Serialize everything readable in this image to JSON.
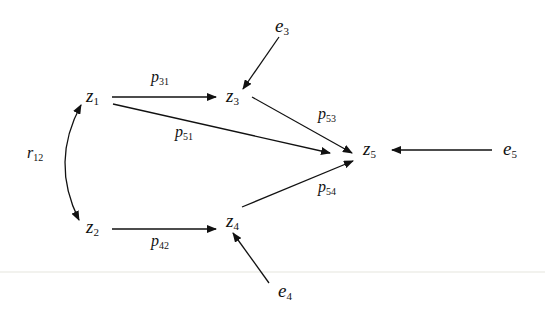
{
  "diagram": {
    "type": "path-analysis",
    "nodes": [
      {
        "id": "z1",
        "base": "z",
        "sub": "1",
        "x": 86,
        "y": 86
      },
      {
        "id": "z2",
        "base": "z",
        "sub": "2",
        "x": 86,
        "y": 217
      },
      {
        "id": "z3",
        "base": "z",
        "sub": "3",
        "x": 226,
        "y": 86
      },
      {
        "id": "z4",
        "base": "z",
        "sub": "4",
        "x": 226,
        "y": 211
      },
      {
        "id": "z5",
        "base": "z",
        "sub": "5",
        "x": 363,
        "y": 139
      },
      {
        "id": "e3",
        "base": "e",
        "sub": "3",
        "x": 275,
        "y": 16
      },
      {
        "id": "e4",
        "base": "e",
        "sub": "4",
        "x": 278,
        "y": 281
      },
      {
        "id": "e5",
        "base": "e",
        "sub": "5",
        "x": 503,
        "y": 139
      }
    ],
    "coefficients": [
      {
        "id": "p31",
        "base": "p",
        "sub": "31",
        "x": 151,
        "y": 69
      },
      {
        "id": "p51",
        "base": "p",
        "sub": "51",
        "x": 175,
        "y": 124
      },
      {
        "id": "p53",
        "base": "p",
        "sub": "53",
        "x": 318,
        "y": 106
      },
      {
        "id": "p54",
        "base": "p",
        "sub": "54",
        "x": 318,
        "y": 179
      },
      {
        "id": "p42",
        "base": "p",
        "sub": "42",
        "x": 151,
        "y": 233
      },
      {
        "id": "r12",
        "base": "r",
        "sub": "12",
        "x": 27,
        "y": 145
      }
    ],
    "edges": [
      {
        "from": "z1",
        "to": "z3",
        "label": "p31"
      },
      {
        "from": "z1",
        "to": "z5",
        "label": "p51"
      },
      {
        "from": "z3",
        "to": "z5",
        "label": "p53"
      },
      {
        "from": "z4",
        "to": "z5",
        "label": "p54"
      },
      {
        "from": "z2",
        "to": "z4",
        "label": "p42"
      },
      {
        "from": "e3",
        "to": "z3",
        "label": ""
      },
      {
        "from": "e4",
        "to": "z4",
        "label": ""
      },
      {
        "from": "e5",
        "to": "z5",
        "label": ""
      },
      {
        "from": "z1",
        "to": "z2",
        "label": "r12",
        "bidirectional": true,
        "curved": true
      }
    ],
    "colors": {
      "line": "#111111",
      "background": "#ffffff"
    }
  },
  "labels": {
    "z1": {
      "base": "z",
      "sub": "1"
    },
    "z2": {
      "base": "z",
      "sub": "2"
    },
    "z3": {
      "base": "z",
      "sub": "3"
    },
    "z4": {
      "base": "z",
      "sub": "4"
    },
    "z5": {
      "base": "z",
      "sub": "5"
    },
    "e3": {
      "base": "e",
      "sub": "3"
    },
    "e4": {
      "base": "e",
      "sub": "4"
    },
    "e5": {
      "base": "e",
      "sub": "5"
    },
    "p31": {
      "base": "p",
      "sub": "31"
    },
    "p51": {
      "base": "p",
      "sub": "51"
    },
    "p53": {
      "base": "p",
      "sub": "53"
    },
    "p54": {
      "base": "p",
      "sub": "54"
    },
    "p42": {
      "base": "p",
      "sub": "42"
    },
    "r12": {
      "base": "r",
      "sub": "12"
    }
  }
}
